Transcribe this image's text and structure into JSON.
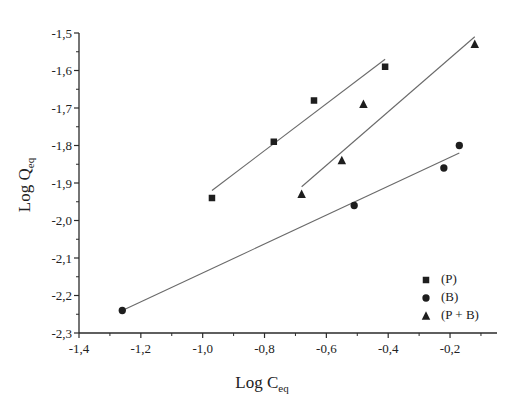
{
  "chart_data": {
    "type": "scatter",
    "title": "",
    "xlabel": "Log C",
    "xlabel_sub": "eq",
    "ylabel": "Log Q",
    "ylabel_sub": "eq",
    "xlim": [
      -1.4,
      -0.08
    ],
    "ylim": [
      -2.3,
      -1.5
    ],
    "grid": false,
    "legend_position": "lower right inside",
    "x_ticks": [
      -1.4,
      -1.2,
      -1.0,
      -0.8,
      -0.6,
      -0.4,
      -0.2
    ],
    "x_tick_labels": [
      "-1,4",
      "-1,2",
      "-1,0",
      "-0,8",
      "-0,6",
      "-0,4",
      "-0,2"
    ],
    "y_ticks": [
      -1.5,
      -1.6,
      -1.7,
      -1.8,
      -1.9,
      -2.0,
      -2.1,
      -2.2,
      -2.3
    ],
    "y_tick_labels": [
      "-1,5",
      "-1,6",
      "-1,7",
      "-1,8",
      "-1,9",
      "-2,0",
      "-2,1",
      "-2,2",
      "-2,3"
    ],
    "series": [
      {
        "name": "(P)",
        "marker": "square",
        "x": [
          -0.97,
          -0.77,
          -0.64,
          -0.41
        ],
        "y": [
          -1.94,
          -1.79,
          -1.68,
          -1.59
        ],
        "fit_line": {
          "x": [
            -0.97,
            -0.41
          ],
          "y": [
            -1.92,
            -1.57
          ]
        }
      },
      {
        "name": "(B)",
        "marker": "circle",
        "x": [
          -1.26,
          -0.51,
          -0.22,
          -0.17
        ],
        "y": [
          -2.24,
          -1.96,
          -1.86,
          -1.8
        ],
        "fit_line": {
          "x": [
            -1.26,
            -0.17
          ],
          "y": [
            -2.24,
            -1.82
          ]
        }
      },
      {
        "name": "(P + B)",
        "marker": "triangle",
        "x": [
          -0.68,
          -0.55,
          -0.48,
          -0.12
        ],
        "y": [
          -1.93,
          -1.84,
          -1.69,
          -1.53
        ],
        "fit_line": {
          "x": [
            -0.68,
            -0.12
          ],
          "y": [
            -1.91,
            -1.51
          ]
        }
      }
    ]
  },
  "legend": {
    "items": [
      {
        "label": "(P)",
        "marker": "square"
      },
      {
        "label": "(B)",
        "marker": "circle"
      },
      {
        "label": "(P + B)",
        "marker": "triangle"
      }
    ]
  },
  "colors": {
    "axis": "#2a2a2a",
    "marker": "#1e1e1e",
    "fit_line": "#6a6a6a",
    "background": "#ffffff"
  }
}
